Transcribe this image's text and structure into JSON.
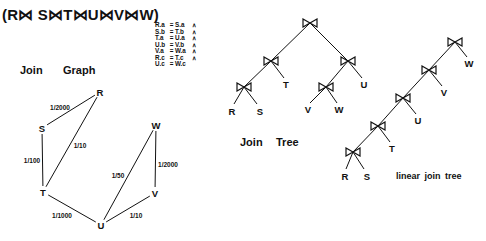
{
  "formula": {
    "parts": [
      "(R",
      "S",
      "T",
      "U",
      "V",
      "W)"
    ],
    "join_symbol": "⋈",
    "text": "(R⋈ S⋈T⋈U⋈V⋈W)"
  },
  "predicates": [
    {
      "lhs": "R.a",
      "eq": "=",
      "rhs": "S.a",
      "conj": "∧"
    },
    {
      "lhs": "S.b",
      "eq": "=",
      "rhs": "T.b",
      "conj": "∧"
    },
    {
      "lhs": "T.a",
      "eq": "=",
      "rhs": "U.a",
      "conj": "∧"
    },
    {
      "lhs": "U.b",
      "eq": "=",
      "rhs": "V.b",
      "conj": "∧"
    },
    {
      "lhs": "V.a",
      "eq": "=",
      "rhs": "W.a",
      "conj": "∧"
    },
    {
      "lhs": "R.c",
      "eq": "=",
      "rhs": "T.c",
      "conj": "∧"
    },
    {
      "lhs": "U.c",
      "eq": "=",
      "rhs": "W.c",
      "conj": ""
    }
  ],
  "join_graph": {
    "title_1": "Join",
    "title_2": "Graph",
    "nodes": {
      "R": {
        "label": "R",
        "x": 100,
        "y": 92
      },
      "S": {
        "label": "S",
        "x": 42,
        "y": 128
      },
      "T": {
        "label": "T",
        "x": 43,
        "y": 192
      },
      "U": {
        "label": "U",
        "x": 101,
        "y": 225
      },
      "V": {
        "label": "V",
        "x": 155,
        "y": 193
      },
      "W": {
        "label": "W",
        "x": 156,
        "y": 125
      }
    },
    "edges": [
      {
        "from": "R",
        "to": "S",
        "label": "1/2000",
        "lx": 60,
        "ly": 107
      },
      {
        "from": "R",
        "to": "T",
        "label": "1/10",
        "lx": 80,
        "ly": 145
      },
      {
        "from": "S",
        "to": "T",
        "label": "1/100",
        "lx": 32,
        "ly": 160
      },
      {
        "from": "T",
        "to": "U",
        "label": "1/1000",
        "lx": 62,
        "ly": 215
      },
      {
        "from": "U",
        "to": "W",
        "label": "1/50",
        "lx": 118,
        "ly": 175
      },
      {
        "from": "W",
        "to": "V",
        "label": "1/2000",
        "lx": 168,
        "ly": 164
      },
      {
        "from": "U",
        "to": "V",
        "label": "1/10",
        "lx": 136,
        "ly": 215
      }
    ]
  },
  "join_tree": {
    "title_1": "Join",
    "title_2": "Tree",
    "join_symbol": "⋈",
    "joins": [
      {
        "id": "j0",
        "x": 310,
        "y": 23
      },
      {
        "id": "j1",
        "x": 271,
        "y": 61
      },
      {
        "id": "j2",
        "x": 348,
        "y": 61
      },
      {
        "id": "j3",
        "x": 244,
        "y": 87
      },
      {
        "id": "j4",
        "x": 326,
        "y": 87
      }
    ],
    "leaves": [
      {
        "label": "R",
        "x": 232,
        "y": 111
      },
      {
        "label": "S",
        "x": 260,
        "y": 111
      },
      {
        "label": "T",
        "x": 286,
        "y": 84
      },
      {
        "label": "V",
        "x": 308,
        "y": 109
      },
      {
        "label": "W",
        "x": 339,
        "y": 109
      },
      {
        "label": "U",
        "x": 364,
        "y": 84
      }
    ]
  },
  "linear_tree": {
    "caption": "linear   join   tree",
    "joins": [
      {
        "x": 455,
        "y": 42
      },
      {
        "x": 429,
        "y": 70
      },
      {
        "x": 403,
        "y": 98
      },
      {
        "x": 378,
        "y": 126
      },
      {
        "x": 353,
        "y": 152
      }
    ],
    "leaves": [
      {
        "label": "W",
        "x": 469,
        "y": 63
      },
      {
        "label": "V",
        "x": 444,
        "y": 92
      },
      {
        "label": "U",
        "x": 418,
        "y": 120
      },
      {
        "label": "T",
        "x": 392,
        "y": 148
      },
      {
        "label": "R",
        "x": 345,
        "y": 176
      },
      {
        "label": "S",
        "x": 367,
        "y": 176
      }
    ]
  }
}
